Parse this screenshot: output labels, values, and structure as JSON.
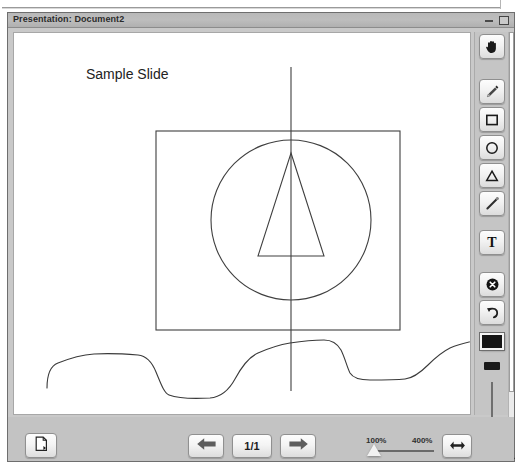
{
  "window": {
    "title": "Presentation: Document2",
    "minimize_label": "Minimize",
    "maximize_label": "Maximize"
  },
  "slide": {
    "text": "Sample Slide",
    "shapes": [
      {
        "name": "rectangle",
        "x": 142,
        "y": 98,
        "w": 244,
        "h": 199
      },
      {
        "name": "circle",
        "cx": 277,
        "cy": 187,
        "r": 80
      },
      {
        "name": "triangle",
        "apex_x": 277,
        "apex_y": 120,
        "base_left_x": 244,
        "base_right_x": 310,
        "base_y": 223
      },
      {
        "name": "vertical-line",
        "x": 277,
        "y1": 35,
        "y2": 360
      },
      {
        "name": "freehand-curve",
        "stroke": "#3a3a3a"
      }
    ],
    "stroke_color": "#3a3a3a"
  },
  "toolbar": {
    "tools": [
      {
        "id": "hand",
        "icon": "hand-icon",
        "label": "Pan"
      },
      {
        "id": "pencil",
        "icon": "pencil-icon",
        "label": "Pencil"
      },
      {
        "id": "rectangle",
        "icon": "rectangle-icon",
        "label": "Rectangle"
      },
      {
        "id": "ellipse",
        "icon": "circle-icon",
        "label": "Ellipse"
      },
      {
        "id": "triangle",
        "icon": "triangle-icon",
        "label": "Triangle"
      },
      {
        "id": "line",
        "icon": "line-icon",
        "label": "Line"
      },
      {
        "id": "text",
        "icon": "text-icon",
        "label": "Text",
        "glyph": "T"
      },
      {
        "id": "delete",
        "icon": "close-circle-icon",
        "label": "Delete"
      },
      {
        "id": "undo",
        "icon": "undo-arrow-icon",
        "label": "Undo"
      }
    ],
    "color_swatch": "#151515",
    "width_swatch_label": "Stroke width",
    "width_slider_label": "Stroke width slider"
  },
  "bottombar": {
    "export_label": "Export slide",
    "prev_label": "Previous slide",
    "next_label": "Next slide",
    "page_indicator": "1/1",
    "fit_label": "Fit width",
    "zoom": {
      "min_label": "100%",
      "max_label": "400%",
      "value": 100
    }
  },
  "scrollbar": {
    "label": "Vertical scrollbar"
  }
}
